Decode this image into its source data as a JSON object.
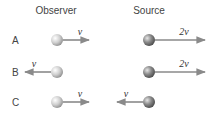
{
  "headers": {
    "observer": "Observer",
    "source": "Source"
  },
  "rows": [
    {
      "label": "A",
      "observer": {
        "direction": "right",
        "velocity": "v"
      },
      "source": {
        "direction": "right",
        "velocity": "2v"
      }
    },
    {
      "label": "B",
      "observer": {
        "direction": "left",
        "velocity": "v"
      },
      "source": {
        "direction": "right",
        "velocity": "2v"
      }
    },
    {
      "label": "C",
      "observer": {
        "direction": "right",
        "velocity": "v"
      },
      "source": {
        "direction": "left",
        "velocity": "v"
      }
    }
  ],
  "colors": {
    "observer_ball": "#c8c8c8",
    "source_ball": "#7a7a7a",
    "arrow": "#8a8a8a"
  }
}
